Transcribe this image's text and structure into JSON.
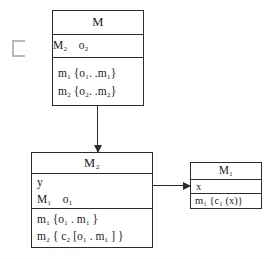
{
  "diagram": {
    "type": "uml-class-diagram",
    "background_color": "#ffffff",
    "line_color": "#2b2b2b",
    "symbols": {
      "subset_symbol": "⊏"
    },
    "boxes": [
      {
        "id": "M",
        "title": "M",
        "attributes": [
          "M₂    o₂"
        ],
        "operations": [
          "m₁ {o₁. .m₁}",
          "m₂ {o₂. .m₂}"
        ]
      },
      {
        "id": "M2",
        "title": "M₂",
        "attributes": [
          "y",
          "M₁    o₁"
        ],
        "operations": [
          "m₁ {o₁ . m₁ }",
          "m₂ { c₂ [o₁ . m₁ ] }"
        ]
      },
      {
        "id": "M1",
        "title": "M₁",
        "attributes": [
          "x"
        ],
        "operations": [
          "m₁ {c₁ (x)}"
        ]
      }
    ],
    "connectors": [
      {
        "id": "m-to-m2",
        "from": "M",
        "to": "M2",
        "direction": "down",
        "style": "solid-arrow"
      },
      {
        "id": "m2-to-m1",
        "from": "M2",
        "to": "M1",
        "direction": "right",
        "style": "solid-arrow"
      }
    ]
  }
}
